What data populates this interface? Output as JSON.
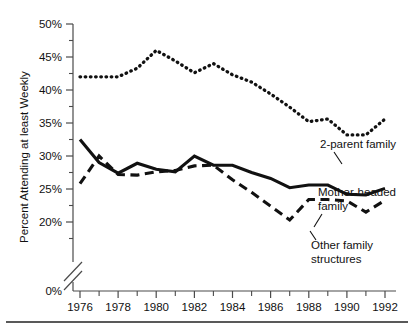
{
  "chart_data": {
    "type": "line",
    "title": "",
    "xlabel": "",
    "ylabel": "Percent Attending at least Weekly",
    "xlim": [
      1976,
      1992
    ],
    "ylim": [
      18.5,
      50
    ],
    "ylim_display": [
      0,
      50
    ],
    "grid": false,
    "legend_position": "inline-annotations",
    "axis_break": true,
    "x": [
      1976,
      1977,
      1978,
      1979,
      1980,
      1981,
      1982,
      1983,
      1984,
      1985,
      1986,
      1987,
      1988,
      1989,
      1990,
      1991,
      1992
    ],
    "y_ticks": [
      0,
      20,
      25,
      30,
      35,
      40,
      45,
      50
    ],
    "y_tick_labels": [
      "0%",
      "20%",
      "25%",
      "30%",
      "35%",
      "40%",
      "45%",
      "50%"
    ],
    "x_ticks": [
      1976,
      1978,
      1980,
      1982,
      1984,
      1986,
      1988,
      1990,
      1992
    ],
    "x_tick_labels": [
      "1976",
      "1978",
      "1980",
      "1982",
      "1984",
      "1986",
      "1988",
      "1990",
      "1992"
    ],
    "x_minor_ticks": [
      1977,
      1979,
      1981,
      1983,
      1985,
      1987,
      1989,
      1991
    ],
    "series": [
      {
        "name": "2-parent family",
        "style": "dotted",
        "label": "2-parent family",
        "values": [
          42.0,
          42.0,
          42.0,
          43.3,
          46.0,
          44.4,
          42.6,
          44.0,
          42.3,
          41.2,
          39.4,
          37.4,
          35.2,
          35.6,
          33.2,
          33.2,
          35.6
        ]
      },
      {
        "name": "Mother-headed family",
        "style": "solid",
        "label": "Mother-headed family",
        "label_line1": "Mother-headed",
        "label_line2": "family",
        "values": [
          32.5,
          29.0,
          27.4,
          28.9,
          28.0,
          27.6,
          30.0,
          28.6,
          28.6,
          27.5,
          26.6,
          25.2,
          25.6,
          25.6,
          24.2,
          24.1,
          25.1
        ]
      },
      {
        "name": "Other family structures",
        "style": "dashed",
        "label": "Other family structures",
        "label_line1": "Other family",
        "label_line2": "structures",
        "values": [
          25.8,
          30.0,
          27.2,
          27.1,
          27.6,
          27.8,
          28.5,
          28.6,
          26.4,
          24.5,
          22.4,
          20.3,
          23.4,
          23.4,
          23.2,
          21.5,
          23.3
        ]
      }
    ],
    "annotations": [
      {
        "name": "2-parent family",
        "text": "2-parent family"
      },
      {
        "name": "Mother-headed family",
        "text_line1": "Mother-headed",
        "text_line2": "family"
      },
      {
        "name": "Other family structures",
        "text_line1": "Other family",
        "text_line2": "structures"
      }
    ],
    "colors": {
      "series_ink": "#111111",
      "axis": "#4a4a4a",
      "background": "#ffffff"
    }
  }
}
